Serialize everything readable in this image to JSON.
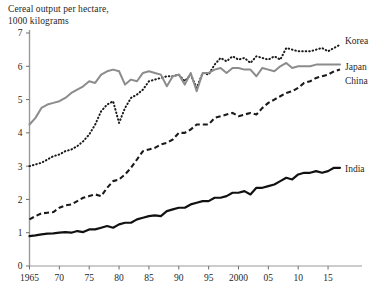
{
  "chart_data": {
    "type": "line",
    "title": "Cereal output per hectare,\n1000 kilograms",
    "xlabel": "",
    "ylabel": "",
    "ylim": [
      0,
      7
    ],
    "xlim": [
      1965,
      2017
    ],
    "yticks": [
      "0",
      "1",
      "2",
      "3",
      "4",
      "5",
      "6",
      "7"
    ],
    "ytick_values": [
      0,
      1,
      2,
      3,
      4,
      5,
      6,
      7
    ],
    "xticks": [
      "1965",
      "70",
      "75",
      "80",
      "85",
      "90",
      "95",
      "2000",
      "05",
      "10",
      "15"
    ],
    "xtick_values": [
      1965,
      1970,
      1975,
      1980,
      1985,
      1990,
      1995,
      2000,
      2005,
      2010,
      2015
    ],
    "grid": false,
    "legend_position": "right-inline",
    "series": [
      {
        "name": "Korea",
        "style": "dotted",
        "color": "#1a1a1a",
        "x": [
          1965,
          1966,
          1967,
          1968,
          1969,
          1970,
          1971,
          1972,
          1973,
          1974,
          1975,
          1976,
          1977,
          1978,
          1979,
          1980,
          1981,
          1982,
          1983,
          1984,
          1985,
          1986,
          1987,
          1988,
          1989,
          1990,
          1991,
          1992,
          1993,
          1994,
          1995,
          1996,
          1997,
          1998,
          1999,
          2000,
          2001,
          2002,
          2003,
          2004,
          2005,
          2006,
          2007,
          2008,
          2009,
          2010,
          2011,
          2012,
          2013,
          2014,
          2015,
          2016,
          2017
        ],
        "values": [
          3.0,
          3.05,
          3.1,
          3.2,
          3.3,
          3.35,
          3.45,
          3.5,
          3.6,
          3.75,
          3.95,
          4.25,
          4.65,
          4.85,
          4.95,
          4.3,
          4.75,
          5.05,
          5.15,
          5.3,
          5.55,
          5.6,
          5.65,
          5.7,
          5.7,
          5.75,
          5.55,
          5.75,
          5.35,
          5.8,
          5.75,
          6.05,
          6.25,
          6.15,
          6.3,
          6.2,
          6.25,
          6.1,
          6.3,
          6.25,
          6.2,
          6.3,
          6.2,
          6.55,
          6.5,
          6.45,
          6.45,
          6.45,
          6.5,
          6.55,
          6.45,
          6.55,
          6.65
        ]
      },
      {
        "name": "Japan",
        "style": "solid-gray",
        "color": "#8c8c8c",
        "x": [
          1965,
          1966,
          1967,
          1968,
          1969,
          1970,
          1971,
          1972,
          1973,
          1974,
          1975,
          1976,
          1977,
          1978,
          1979,
          1980,
          1981,
          1982,
          1983,
          1984,
          1985,
          1986,
          1987,
          1988,
          1989,
          1990,
          1991,
          1992,
          1993,
          1994,
          1995,
          1996,
          1997,
          1998,
          1999,
          2000,
          2001,
          2002,
          2003,
          2004,
          2005,
          2006,
          2007,
          2008,
          2009,
          2010,
          2011,
          2012,
          2013,
          2014,
          2015,
          2016,
          2017
        ],
        "values": [
          4.25,
          4.45,
          4.75,
          4.85,
          4.9,
          4.95,
          5.05,
          5.2,
          5.3,
          5.4,
          5.55,
          5.5,
          5.75,
          5.85,
          5.9,
          5.85,
          5.45,
          5.6,
          5.55,
          5.8,
          5.85,
          5.8,
          5.75,
          5.4,
          5.7,
          5.75,
          5.45,
          5.8,
          5.25,
          5.8,
          5.8,
          5.9,
          5.95,
          5.8,
          5.95,
          5.95,
          5.9,
          5.9,
          5.7,
          5.95,
          5.9,
          5.85,
          6.0,
          6.1,
          5.95,
          6.0,
          6.0,
          6.0,
          6.05,
          6.05,
          6.05,
          6.05,
          6.05
        ]
      },
      {
        "name": "China",
        "style": "dashed",
        "color": "#1a1a1a",
        "x": [
          1965,
          1966,
          1967,
          1968,
          1969,
          1970,
          1971,
          1972,
          1973,
          1974,
          1975,
          1976,
          1977,
          1978,
          1979,
          1980,
          1981,
          1982,
          1983,
          1984,
          1985,
          1986,
          1987,
          1988,
          1989,
          1990,
          1991,
          1992,
          1993,
          1994,
          1995,
          1996,
          1997,
          1998,
          1999,
          2000,
          2001,
          2002,
          2003,
          2004,
          2005,
          2006,
          2007,
          2008,
          2009,
          2010,
          2011,
          2012,
          2013,
          2014,
          2015,
          2016,
          2017
        ],
        "values": [
          1.4,
          1.5,
          1.58,
          1.6,
          1.62,
          1.75,
          1.82,
          1.85,
          1.95,
          2.05,
          2.1,
          2.15,
          2.1,
          2.35,
          2.55,
          2.6,
          2.75,
          2.95,
          3.2,
          3.45,
          3.5,
          3.55,
          3.65,
          3.7,
          3.8,
          4.0,
          4.0,
          4.1,
          4.25,
          4.25,
          4.25,
          4.45,
          4.5,
          4.55,
          4.6,
          4.5,
          4.55,
          4.6,
          4.55,
          4.75,
          4.9,
          5.0,
          5.1,
          5.2,
          5.25,
          5.35,
          5.5,
          5.55,
          5.65,
          5.7,
          5.75,
          5.85,
          5.9
        ]
      },
      {
        "name": "India",
        "style": "solid-black",
        "color": "#111111",
        "x": [
          1965,
          1966,
          1967,
          1968,
          1969,
          1970,
          1971,
          1972,
          1973,
          1974,
          1975,
          1976,
          1977,
          1978,
          1979,
          1980,
          1981,
          1982,
          1983,
          1984,
          1985,
          1986,
          1987,
          1988,
          1989,
          1990,
          1991,
          1992,
          1993,
          1994,
          1995,
          1996,
          1997,
          1998,
          1999,
          2000,
          2001,
          2002,
          2003,
          2004,
          2005,
          2006,
          2007,
          2008,
          2009,
          2010,
          2011,
          2012,
          2013,
          2014,
          2015,
          2016,
          2017
        ],
        "values": [
          0.9,
          0.92,
          0.95,
          0.97,
          0.98,
          1.0,
          1.02,
          1.0,
          1.05,
          1.02,
          1.1,
          1.1,
          1.15,
          1.2,
          1.15,
          1.25,
          1.3,
          1.3,
          1.4,
          1.45,
          1.5,
          1.52,
          1.5,
          1.65,
          1.7,
          1.75,
          1.75,
          1.85,
          1.9,
          1.95,
          1.95,
          2.05,
          2.05,
          2.1,
          2.2,
          2.2,
          2.25,
          2.15,
          2.35,
          2.35,
          2.4,
          2.45,
          2.55,
          2.65,
          2.6,
          2.75,
          2.8,
          2.8,
          2.85,
          2.8,
          2.85,
          2.95,
          2.95
        ]
      }
    ]
  }
}
